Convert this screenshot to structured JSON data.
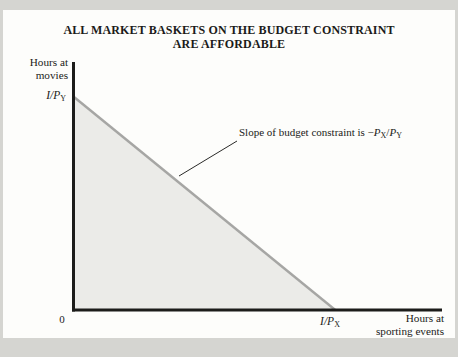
{
  "figure": {
    "title_line1": "ALL MARKET BASKETS ON THE BUDGET CONSTRAINT",
    "title_line2": "ARE AFFORDABLE"
  },
  "axes": {
    "y_label_line1": "Hours at",
    "y_label_line2": "movies",
    "x_label_line1": "Hours at",
    "x_label_line2": "sporting events",
    "origin": "0"
  },
  "labels": {
    "y_intercept": {
      "base": "I/P",
      "sub": "Y"
    },
    "x_intercept": {
      "base": "I/P",
      "sub": "X"
    }
  },
  "annotation": {
    "prefix": "Slope of budget constraint is −",
    "var1": "P",
    "sub1": "X",
    "divider": "/",
    "var2": "P",
    "sub2": "Y"
  },
  "chart_data": {
    "type": "line",
    "title": "ALL MARKET BASKETS ON THE BUDGET CONSTRAINT ARE AFFORDABLE",
    "xlabel": "Hours at sporting events",
    "ylabel": "Hours at movies",
    "x_ticks": [
      "0",
      "I/P_X"
    ],
    "y_ticks": [
      "I/P_Y"
    ],
    "slope_label": "-P_X/P_Y",
    "series": [
      {
        "name": "budget-constraint-line",
        "points_frac": [
          [
            0,
            0.859
          ],
          [
            0.71,
            0
          ]
        ],
        "color": "#a6a6a4",
        "width": 2.4
      }
    ],
    "shaded_region": {
      "name": "affordable-set",
      "vertices_frac": [
        [
          0,
          0.859
        ],
        [
          0,
          0
        ],
        [
          0.71,
          0
        ]
      ],
      "color": "#ebebe8"
    },
    "annotation": {
      "text": "Slope of budget constraint is −P_X/P_Y",
      "leader_from_px": [
        237,
        141
      ],
      "leader_to_px": [
        179,
        176
      ],
      "leader_color": "#2a2a28"
    },
    "axis_color": "#1c1c1a",
    "grid": false,
    "legend": false
  }
}
